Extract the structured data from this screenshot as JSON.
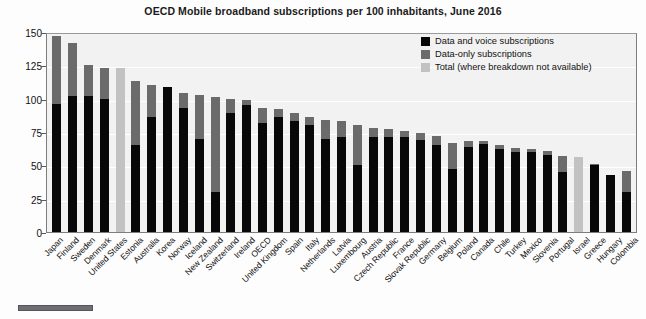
{
  "chart_data": {
    "type": "bar",
    "title": "OECD Mobile broadband subscriptions per 100 inhabitants, June 2016",
    "xlabel": "",
    "ylabel": "",
    "ylim": [
      0,
      150
    ],
    "yticks": [
      0,
      25,
      50,
      75,
      100,
      125,
      150
    ],
    "grid": true,
    "stacked": true,
    "legend_position": "top-right",
    "colors": {
      "data_and_voice": "#080808",
      "data_only": "#6b6b6b",
      "total_only": "#c2c2c2",
      "plot_background": "#f2f2f2"
    },
    "legend": [
      "Data and voice subscriptions",
      "Data-only subscriptions",
      "Total (where breakdown not available)"
    ],
    "categories": [
      "Japan",
      "Finland",
      "Sweden",
      "Denmark",
      "United States",
      "Estonia",
      "Australia",
      "Korea",
      "Norway",
      "Iceland",
      "New Zealand",
      "Switzerland",
      "Ireland",
      "OECD",
      "United Kingdom",
      "Spain",
      "Italy",
      "Netherlands",
      "Latvia",
      "Luxembourg",
      "Austria",
      "Czech Republic",
      "France",
      "Slovak Republic",
      "Germany",
      "Belgium",
      "Poland",
      "Canada",
      "Chile",
      "Turkey",
      "Mexico",
      "Slovenia",
      "Portugal",
      "Israel",
      "Greece",
      "Hungary",
      "Colombia"
    ],
    "series": [
      {
        "name": "Data and voice subscriptions",
        "values": [
          96,
          102,
          102,
          100,
          0,
          65,
          86,
          109,
          93,
          70,
          30,
          89,
          95,
          82,
          86,
          83,
          80,
          70,
          71,
          50,
          71,
          71,
          71,
          69,
          65,
          47,
          64,
          66,
          62,
          60,
          60,
          58,
          45,
          0,
          50,
          43,
          30
        ]
      },
      {
        "name": "Data-only subscriptions",
        "values": [
          51,
          40,
          23,
          23,
          0,
          48,
          24,
          0,
          11,
          33,
          71,
          11,
          4,
          11,
          6,
          6,
          6,
          14,
          12,
          30,
          7,
          6,
          5,
          5,
          7,
          20,
          4,
          2,
          3,
          3,
          2,
          3,
          12,
          0,
          1,
          0,
          16
        ]
      },
      {
        "name": "Total (where breakdown not available)",
        "values": [
          0,
          0,
          0,
          0,
          123,
          0,
          0,
          0,
          0,
          0,
          0,
          0,
          0,
          0,
          0,
          0,
          0,
          0,
          0,
          0,
          0,
          0,
          0,
          0,
          0,
          0,
          0,
          0,
          0,
          0,
          0,
          0,
          0,
          56,
          0,
          0,
          0
        ]
      }
    ],
    "totals": [
      147,
      142,
      125,
      123,
      123,
      113,
      110,
      109,
      104,
      103,
      101,
      100,
      99,
      93,
      92,
      89,
      86,
      84,
      83,
      80,
      78,
      77,
      76,
      74,
      72,
      67,
      68,
      68,
      65,
      63,
      62,
      61,
      57,
      56,
      51,
      43,
      46
    ]
  }
}
